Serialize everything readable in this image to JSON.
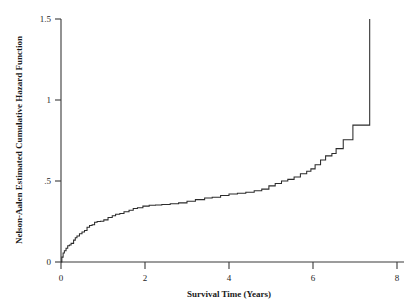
{
  "chart_data": {
    "type": "line",
    "title": "",
    "subtitle": "",
    "xlabel": "Survival Time (Years)",
    "ylabel": "Nelson-Aalen Estimated Cumulative Hazard Function",
    "xlim": [
      -0.15,
      8.4
    ],
    "ylim": [
      0,
      1.55
    ],
    "xticks": [
      0,
      2,
      4,
      6,
      8
    ],
    "xticklabels": [
      "0",
      "2",
      "4",
      "6",
      "8"
    ],
    "yticks": [
      0,
      0.5,
      1,
      1.5
    ],
    "yticklabels": [
      "0",
      ".5",
      "1",
      "1.5"
    ],
    "grid": false,
    "legend": null,
    "legend_position": "none",
    "series": [
      {
        "name": "Nelson-Aalen cumulative hazard",
        "step": "post",
        "x": [
          0.02,
          0.05,
          0.08,
          0.12,
          0.16,
          0.2,
          0.24,
          0.3,
          0.34,
          0.38,
          0.44,
          0.5,
          0.56,
          0.62,
          0.68,
          0.74,
          0.8,
          0.86,
          0.94,
          1.02,
          1.12,
          1.22,
          1.3,
          1.4,
          1.5,
          1.62,
          1.72,
          1.82,
          1.95,
          2.1,
          2.25,
          2.4,
          2.6,
          2.8,
          3.0,
          3.2,
          3.42,
          3.6,
          3.8,
          4.0,
          4.2,
          4.4,
          4.6,
          4.78,
          4.95,
          5.1,
          5.25,
          5.4,
          5.55,
          5.7,
          5.85,
          5.95,
          6.05,
          6.18,
          6.3,
          6.45,
          6.55,
          6.72,
          6.95,
          7.3,
          7.35
        ],
        "y": [
          0.03,
          0.055,
          0.07,
          0.085,
          0.1,
          0.105,
          0.115,
          0.135,
          0.15,
          0.16,
          0.175,
          0.185,
          0.195,
          0.215,
          0.225,
          0.23,
          0.245,
          0.25,
          0.252,
          0.26,
          0.275,
          0.285,
          0.295,
          0.3,
          0.31,
          0.32,
          0.33,
          0.335,
          0.345,
          0.35,
          0.352,
          0.355,
          0.36,
          0.365,
          0.375,
          0.385,
          0.395,
          0.4,
          0.41,
          0.42,
          0.425,
          0.43,
          0.44,
          0.45,
          0.47,
          0.485,
          0.5,
          0.51,
          0.525,
          0.545,
          0.56,
          0.575,
          0.6,
          0.63,
          0.655,
          0.67,
          0.7,
          0.755,
          0.845,
          0.845,
          1.5
        ]
      }
    ]
  },
  "axes": {
    "y_axis_name": "y-axis",
    "x_axis_name": "x-axis"
  }
}
